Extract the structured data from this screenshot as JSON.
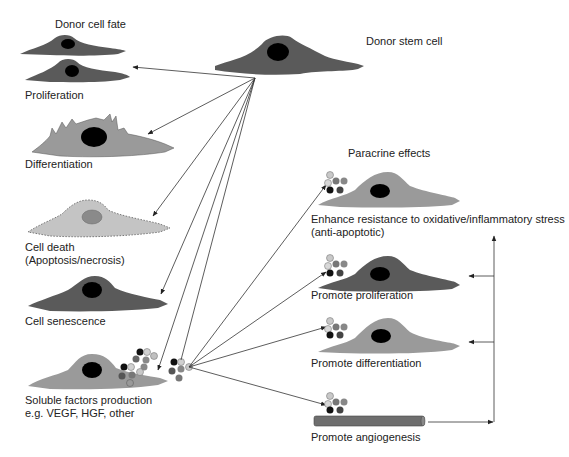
{
  "title": "Donor cell fate",
  "source": {
    "label": "Donor stem cell"
  },
  "fates": [
    {
      "id": "proliferation",
      "label": "Proliferation"
    },
    {
      "id": "differentiation",
      "label": "Differentiation"
    },
    {
      "id": "cell-death",
      "label": "Cell death",
      "sublabel": "(Apoptosis/necrosis)"
    },
    {
      "id": "senescence",
      "label": "Cell senescence"
    },
    {
      "id": "soluble-factors",
      "label": "Soluble factors production",
      "sublabel": "e.g. VEGF, HGF, other"
    }
  ],
  "paracrine": {
    "title": "Paracrine effects",
    "effects": [
      {
        "id": "resistance",
        "label": "Enhance resistance to oxidative/inflammatory stress",
        "sublabel": "(anti-apoptotic)"
      },
      {
        "id": "proliferation",
        "label": "Promote proliferation"
      },
      {
        "id": "differentiation",
        "label": "Promote differentiation"
      },
      {
        "id": "angiogenesis",
        "label": "Promote angiogenesis"
      }
    ]
  },
  "colors": {
    "dark_cell": "#5a5a5a",
    "light_cell": "#9a9a9a",
    "dead_cell": "#c4c4c4",
    "nucleus": "#000000",
    "dead_nucleus": "#8a8a8a",
    "arrow": "#333333",
    "vessel": "#6e6e6e"
  }
}
